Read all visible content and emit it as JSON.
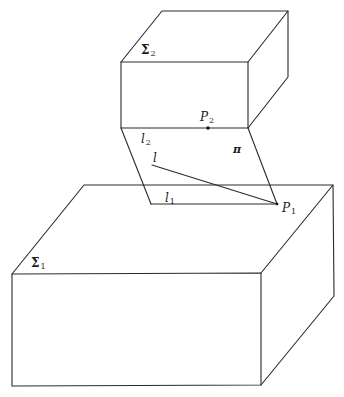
{
  "figure": {
    "width": 344,
    "height": 397,
    "line_color": "#2a2a2a",
    "background": "#ffffff"
  },
  "labels": {
    "sigma2": {
      "symbol": "Σ",
      "sub": "2"
    },
    "sigma1": {
      "symbol": "Σ",
      "sub": "1"
    },
    "p2": {
      "symbol": "P",
      "sub": "2"
    },
    "p1": {
      "symbol": "P",
      "sub": "1"
    },
    "l2": {
      "symbol": "l",
      "sub": "2"
    },
    "l1": {
      "symbol": "l",
      "sub": "1"
    },
    "l": {
      "symbol": "l"
    },
    "pi": {
      "symbol": "π"
    }
  },
  "geometry": {
    "upper_box_sigma2": {
      "top_face": [
        [
          162,
          11
        ],
        [
          288,
          11
        ],
        [
          248,
          62
        ],
        [
          121,
          62
        ]
      ],
      "front_face": [
        [
          121,
          62
        ],
        [
          248,
          62
        ],
        [
          248,
          128
        ],
        [
          121,
          128
        ]
      ],
      "right_face": [
        [
          248,
          62
        ],
        [
          288,
          11
        ],
        [
          288,
          77
        ],
        [
          248,
          128
        ]
      ]
    },
    "plane_pi": [
      [
        121,
        128
      ],
      [
        248,
        128
      ],
      [
        277,
        204
      ],
      [
        151,
        204
      ]
    ],
    "line_l": [
      [
        152,
        165
      ],
      [
        277,
        204
      ]
    ],
    "point_p2": [
      208,
      128
    ],
    "point_p1": [
      277,
      204
    ],
    "lower_box_sigma1": {
      "top_face": [
        [
          84,
          185
        ],
        [
          333,
          185
        ],
        [
          261,
          273
        ],
        [
          12,
          274
        ]
      ],
      "front_face": [
        [
          12,
          274
        ],
        [
          261,
          273
        ],
        [
          261,
          385
        ],
        [
          12,
          386
        ]
      ],
      "right_face": [
        [
          261,
          273
        ],
        [
          333,
          185
        ],
        [
          334,
          296
        ],
        [
          261,
          385
        ]
      ]
    }
  }
}
